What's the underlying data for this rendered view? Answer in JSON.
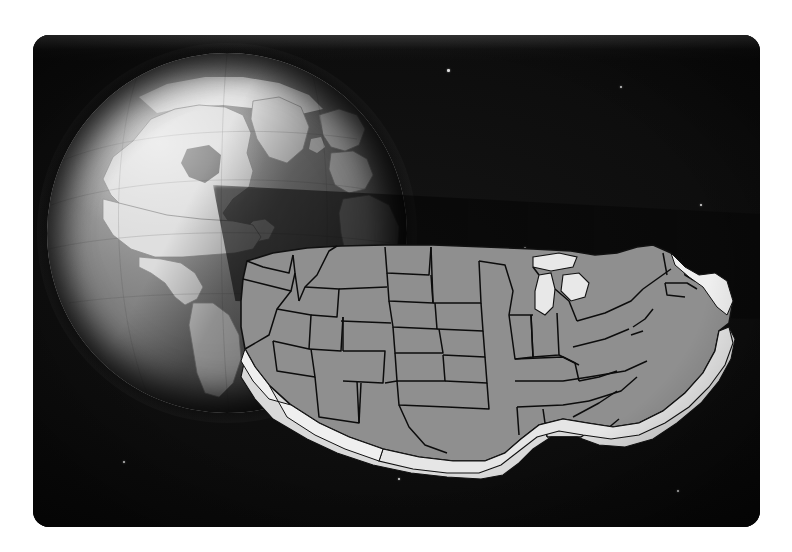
{
  "image": {
    "title": "Three-dimensional map of the contiguous United States in front of a shaded globe",
    "kind": "illustration",
    "background_color": "#080808",
    "frame": {
      "outer_margin_color": "#ffffff",
      "corner_radius_px": 16,
      "x": 33,
      "y": 35,
      "width": 727,
      "height": 492
    }
  },
  "globe": {
    "name": "earth-globe",
    "center_x": 194,
    "center_y": 198,
    "radius": 180,
    "ocean_color": "#7a7a7a",
    "land_color": "#dcdcdc",
    "shadow_color": "#3a3a3a",
    "highlight_color": "#f2f2f2",
    "limb_color": "#1c1c1c",
    "features": [
      "North America",
      "Greenland",
      "Canada",
      "Arctic ice cap",
      "Europe",
      "Africa",
      "South America",
      "Atlantic Ocean",
      "Pacific Ocean",
      "Central America",
      "Caribbean"
    ],
    "lighting": "sunlit upper-left, terminator shadow to the lower-right",
    "graticule": "faint latitude and longitude lines"
  },
  "shadow_wedge": {
    "name": "cast-shadow-band",
    "description": "dark conical shadow extending to the right from the globe across the upper map region",
    "color": "#000000",
    "opacity": 0.72
  },
  "us_map": {
    "name": "united-states-3d-map",
    "style": "extruded three-dimensional relief",
    "face_color": "#8f8f8f",
    "border_color": "#0c0c0c",
    "extrusion_color": "#d9d9d9",
    "lake_color": "#e8e8e8",
    "region": "contiguous United States (lower 48)",
    "state_count": 48,
    "state_borders_visible": true,
    "great_lakes_visible": true,
    "states": [
      "Washington",
      "Oregon",
      "California",
      "Nevada",
      "Idaho",
      "Montana",
      "Wyoming",
      "Utah",
      "Arizona",
      "Colorado",
      "New Mexico",
      "North Dakota",
      "South Dakota",
      "Nebraska",
      "Kansas",
      "Oklahoma",
      "Texas",
      "Minnesota",
      "Iowa",
      "Missouri",
      "Arkansas",
      "Louisiana",
      "Wisconsin",
      "Illinois",
      "Michigan",
      "Indiana",
      "Ohio",
      "Kentucky",
      "Tennessee",
      "Mississippi",
      "Alabama",
      "Florida",
      "Georgia",
      "South Carolina",
      "North Carolina",
      "Virginia",
      "West Virginia",
      "Maryland",
      "Delaware",
      "Pennsylvania",
      "New Jersey",
      "New York",
      "Connecticut",
      "Rhode Island",
      "Massachusetts",
      "Vermont",
      "New Hampshire",
      "Maine"
    ]
  },
  "starfield": {
    "name": "star-field",
    "star_color": "#dcdcdc",
    "count": 14,
    "stars": [
      {
        "x": 57.0,
        "y": 7.0,
        "r": 1.3
      },
      {
        "x": 80.7,
        "y": 10.4,
        "r": 1.1
      },
      {
        "x": 44.1,
        "y": 19.9,
        "r": 1.2
      },
      {
        "x": 67.5,
        "y": 43.0,
        "r": 1.1
      },
      {
        "x": 31.6,
        "y": 24.9,
        "r": 1.0
      },
      {
        "x": 53.0,
        "y": 49.8,
        "r": 1.2
      },
      {
        "x": 24.1,
        "y": 65.2,
        "r": 1.0
      },
      {
        "x": 60.5,
        "y": 68.3,
        "r": 1.1
      },
      {
        "x": 88.6,
        "y": 92.4,
        "r": 1.0
      },
      {
        "x": 50.2,
        "y": 90.0,
        "r": 1.1
      },
      {
        "x": 91.8,
        "y": 34.4,
        "r": 1.0
      },
      {
        "x": 15.7,
        "y": 30.8,
        "r": 0.9
      },
      {
        "x": 73.4,
        "y": 76.1,
        "r": 0.9
      },
      {
        "x": 12.4,
        "y": 86.6,
        "r": 0.9
      }
    ]
  }
}
